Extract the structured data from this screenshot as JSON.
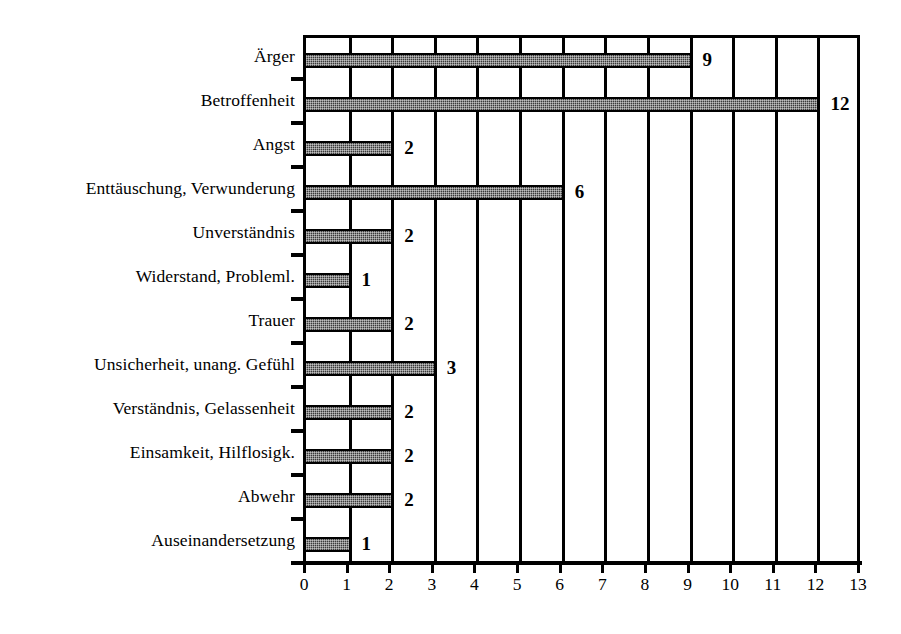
{
  "chart_data": {
    "type": "bar",
    "orientation": "horizontal",
    "title": "",
    "subtitle": "",
    "xlabel": "",
    "ylabel": "",
    "xlim": [
      0,
      13
    ],
    "ylim": null,
    "grid": true,
    "grid_axis": "x",
    "legend": false,
    "legend_position": "none",
    "value_labels": true,
    "bar_color": "#3a3a3a",
    "bar_pattern": "fine-checker-dither",
    "axis_color": "#000000",
    "background": "#ffffff",
    "xticks": [
      "0",
      "1",
      "2",
      "3",
      "4",
      "5",
      "6",
      "7",
      "8",
      "9",
      "10",
      "11",
      "12",
      "13"
    ],
    "categories": [
      "Ärger",
      "Betroffenheit",
      "Angst",
      "Enttäuschung, Verwunderung",
      "Unverständnis",
      "Widerstand, Probleml.",
      "Trauer",
      "Unsicherheit, unang. Gefühl",
      "Verständnis, Gelassenheit",
      "Einsamkeit, Hilflosigk.",
      "Abwehr",
      "Auseinandersetzung"
    ],
    "values": [
      9,
      12,
      2,
      6,
      2,
      1,
      2,
      3,
      2,
      2,
      2,
      1
    ],
    "value_label_texts": [
      "9",
      "12",
      "2",
      "6",
      "2",
      "1",
      "2",
      "3",
      "2",
      "2",
      "2",
      "1"
    ]
  }
}
